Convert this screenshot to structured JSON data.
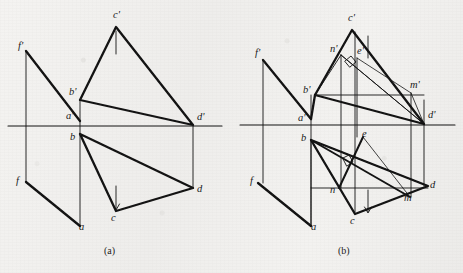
{
  "document": {
    "type": "engineering-drawing",
    "title": "Orthographic projection exercise - two-view descriptive geometry figures",
    "background_color": "#f1f0ee",
    "line_color": "#111111"
  },
  "figures": [
    {
      "id": "figure-a",
      "caption": "(a)",
      "caption_pos": {
        "x": 104,
        "y": 245
      },
      "ground_line": {
        "x1": 8,
        "y1": 126,
        "x2": 222,
        "y2": 126
      },
      "labels": [
        {
          "name": "f-prime",
          "text": "f'",
          "x": 18,
          "y": 41
        },
        {
          "name": "c-prime",
          "text": "c'",
          "x": 113,
          "y": 10
        },
        {
          "name": "b-prime",
          "text": "b'",
          "x": 69,
          "y": 87
        },
        {
          "name": "a-prime",
          "text": "a'",
          "x": 66,
          "y": 111
        },
        {
          "name": "d-prime",
          "text": "d'",
          "x": 197,
          "y": 112
        },
        {
          "name": "b",
          "text": "b",
          "x": 70,
          "y": 132
        },
        {
          "name": "f",
          "text": "f",
          "x": 16,
          "y": 176
        },
        {
          "name": "d",
          "text": "d",
          "x": 197,
          "y": 184
        },
        {
          "name": "c",
          "text": "c",
          "x": 111,
          "y": 213
        },
        {
          "name": "a",
          "text": "a",
          "x": 79,
          "y": 222
        }
      ],
      "vertices": {
        "f_prime": [
          26,
          51
        ],
        "c_prime": [
          116,
          27
        ],
        "b_prime": [
          80,
          100
        ],
        "a_prime": [
          80,
          121
        ],
        "d_prime": [
          193,
          125
        ],
        "b": [
          80,
          134
        ],
        "f": [
          26,
          182
        ],
        "d": [
          193,
          188
        ],
        "c": [
          116,
          211
        ],
        "a": [
          80,
          226
        ]
      }
    },
    {
      "id": "figure-b",
      "caption": "(b)",
      "caption_pos": {
        "x": 338,
        "y": 245
      },
      "ground_line": {
        "x1": 240,
        "y1": 125,
        "x2": 455,
        "y2": 125
      },
      "labels": [
        {
          "name": "f-prime",
          "text": "f'",
          "x": 255,
          "y": 48
        },
        {
          "name": "c-prime",
          "text": "c'",
          "x": 348,
          "y": 13
        },
        {
          "name": "n-prime",
          "text": "n'",
          "x": 330,
          "y": 44
        },
        {
          "name": "e-prime",
          "text": "e'",
          "x": 357,
          "y": 46
        },
        {
          "name": "b-prime",
          "text": "b'",
          "x": 303,
          "y": 85
        },
        {
          "name": "m-prime",
          "text": "m'",
          "x": 410,
          "y": 80
        },
        {
          "name": "a-prime",
          "text": "a'",
          "x": 298,
          "y": 113
        },
        {
          "name": "d-prime",
          "text": "d'",
          "x": 428,
          "y": 110
        },
        {
          "name": "b",
          "text": "b",
          "x": 301,
          "y": 133
        },
        {
          "name": "e",
          "text": "e",
          "x": 362,
          "y": 129
        },
        {
          "name": "f",
          "text": "f",
          "x": 250,
          "y": 176
        },
        {
          "name": "n",
          "text": "n",
          "x": 330,
          "y": 185
        },
        {
          "name": "d",
          "text": "d",
          "x": 430,
          "y": 180
        },
        {
          "name": "m",
          "text": "m",
          "x": 404,
          "y": 193
        },
        {
          "name": "c",
          "text": "c",
          "x": 350,
          "y": 216
        },
        {
          "name": "a",
          "text": "a",
          "x": 311,
          "y": 222
        }
      ],
      "vertices": {
        "f_prime": [
          263,
          60
        ],
        "c_prime": [
          352,
          30
        ],
        "n_prime": [
          341,
          55
        ],
        "e_prime": [
          357,
          58
        ],
        "b_prime": [
          315,
          95
        ],
        "m_prime": [
          411,
          93
        ],
        "a_prime": [
          311,
          119
        ],
        "d_prime": [
          424,
          124
        ],
        "b": [
          311,
          140
        ],
        "e": [
          363,
          137
        ],
        "f": [
          258,
          183
        ],
        "n": [
          339,
          188
        ],
        "d": [
          428,
          186
        ],
        "m": [
          410,
          197
        ],
        "c": [
          355,
          214
        ],
        "a": [
          311,
          226
        ]
      },
      "right_angle_markers": [
        {
          "name": "right-angle-upper",
          "x": 350,
          "y": 66
        },
        {
          "name": "right-angle-lower",
          "x": 348,
          "y": 162
        }
      ]
    }
  ]
}
